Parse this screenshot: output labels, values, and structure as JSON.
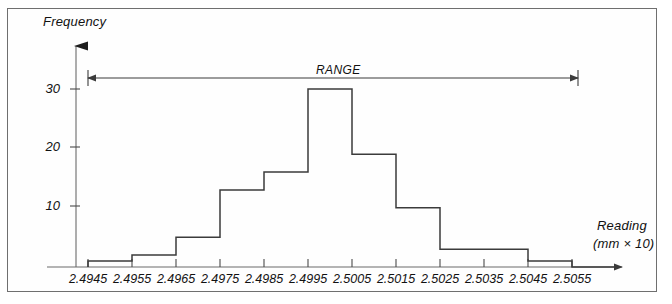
{
  "figure": {
    "y_axis_title": "Frequency",
    "x_axis_title": "Reading",
    "x_axis_units": "(mm × 10)",
    "range_annotation": "RANGE",
    "line_color": "#3b3b3b",
    "border_color": "#6f6f6f",
    "background": "#fefefe"
  },
  "chart_data": {
    "type": "bar",
    "title": "",
    "subtitle": "",
    "xlabel": "Reading (mm × 10)",
    "ylabel": "Frequency",
    "categories": [
      "2.4945",
      "2.4955",
      "2.4965",
      "2.4975",
      "2.4985",
      "2.4995",
      "2.5005",
      "2.5015",
      "2.5025",
      "2.5035",
      "2.5045",
      "2.5055"
    ],
    "values": [
      1,
      2,
      5,
      13,
      16,
      30,
      19,
      10,
      3,
      3,
      1,
      0
    ],
    "ylim": [
      0,
      34
    ],
    "yticks": [
      10,
      20,
      30
    ],
    "ytick_labels": [
      "10",
      "20",
      "30"
    ],
    "xtick_labels": [
      "2.4945",
      "2.4955",
      "2.4965",
      "2.4975",
      "2.4985",
      "2.4995",
      "2.5005",
      "2.5015",
      "2.5025",
      "2.5035",
      "2.5045",
      "2.5055"
    ],
    "grid": false,
    "legend": false,
    "bar_style": "outline",
    "annotations": [
      {
        "text": "RANGE",
        "type": "double-arrow",
        "from_category": "2.4945",
        "to_category": "2.5055",
        "at_frequency": 32
      }
    ]
  }
}
